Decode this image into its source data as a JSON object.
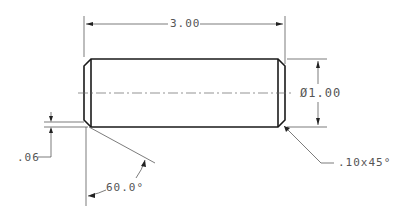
{
  "drawing": {
    "title": "Dowel pin technical drawing",
    "line_color": "#1a1a1a",
    "dim_color": "#555555"
  },
  "dimensions": {
    "length": "3.00",
    "diameter": "Ø1.00",
    "chamfer_edge": ".06",
    "chamfer_angle": "60.0°",
    "chamfer_note": ".10x45°"
  }
}
